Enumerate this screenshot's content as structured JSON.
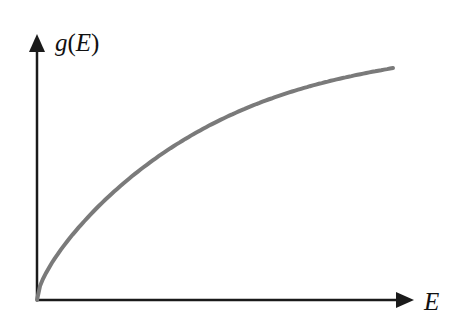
{
  "chart_data": {
    "type": "line",
    "title": "",
    "xlabel": "E",
    "ylabel": "g(E)",
    "ylabel_parts": {
      "func": "g",
      "open": "(",
      "var": "E",
      "close": ")"
    },
    "x": [
      0,
      0.05,
      0.15,
      0.3,
      0.5,
      0.7,
      0.85,
      1.0
    ],
    "values": [
      0,
      0.3,
      0.53,
      0.66,
      0.76,
      0.83,
      0.86,
      0.88
    ],
    "grid": false,
    "ticks": false,
    "colors": {
      "curve": "#7a7a7a",
      "axes": "#1a1a1a"
    }
  }
}
